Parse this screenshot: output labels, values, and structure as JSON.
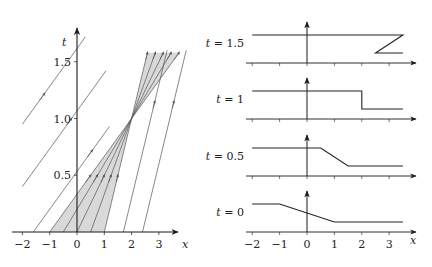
{
  "left_plot": {
    "x_axis_label": "x",
    "t_axis_label": "t",
    "x_ticks": [
      {
        "value": -2,
        "label": "−2"
      },
      {
        "value": -1,
        "label": "−1"
      },
      {
        "value": 0,
        "label": "0"
      },
      {
        "value": 1,
        "label": "1"
      },
      {
        "value": 2,
        "label": "2"
      },
      {
        "value": 3,
        "label": "3"
      }
    ],
    "t_ticks": [
      {
        "value": 0.5,
        "label": "0.5"
      },
      {
        "value": 1.0,
        "label": "1.0"
      },
      {
        "value": 1.5,
        "label": "1.5"
      }
    ],
    "shock_point": {
      "x": 2,
      "t": 1
    },
    "speed_high": 3,
    "speed_low": 1
  },
  "right_plots": {
    "x_axis_label": "x",
    "x_ticks": [
      {
        "value": -2,
        "label": "−2"
      },
      {
        "value": -1,
        "label": "−1"
      },
      {
        "value": 0,
        "label": "0"
      },
      {
        "value": 1,
        "label": "1"
      },
      {
        "value": 2,
        "label": "2"
      },
      {
        "value": 3,
        "label": "3"
      }
    ],
    "panels": [
      {
        "label": "t = 1.5",
        "profile": [
          [
            -2,
            1
          ],
          [
            3.5,
            1
          ],
          [
            2.5,
            0
          ],
          [
            3.5,
            0
          ]
        ]
      },
      {
        "label": "t = 1",
        "profile": [
          [
            -2,
            1
          ],
          [
            2,
            1
          ],
          [
            2,
            0
          ],
          [
            3.5,
            0
          ]
        ]
      },
      {
        "label": "t = 0.5",
        "profile": [
          [
            -2,
            1
          ],
          [
            0.5,
            1
          ],
          [
            1.5,
            0
          ],
          [
            3.5,
            0
          ]
        ]
      },
      {
        "label": "t = 0",
        "profile": [
          [
            -2,
            1
          ],
          [
            -1,
            1
          ],
          [
            1,
            0
          ],
          [
            3.5,
            0
          ]
        ]
      }
    ]
  },
  "colors": {
    "axis": "#1a1a1a",
    "characteristic": "#555555",
    "fan_fill": "#d9d9d9",
    "profile": "#222222"
  }
}
